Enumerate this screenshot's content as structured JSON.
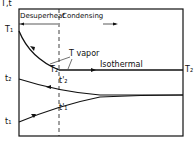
{
  "diagram": {
    "axis_label": "T,t",
    "regions": {
      "left": "Desuperheat",
      "right": "Condensing"
    },
    "curves": {
      "T1": "T₁",
      "T2_mid": "T₂",
      "T2_right": "T₂",
      "t2": "t₂",
      "t2_prime": "t'₂",
      "t1": "t₁",
      "t1_prime": "t'₁"
    },
    "annotations": {
      "vapor": "T vapor",
      "isothermal": "Isothermal"
    }
  }
}
